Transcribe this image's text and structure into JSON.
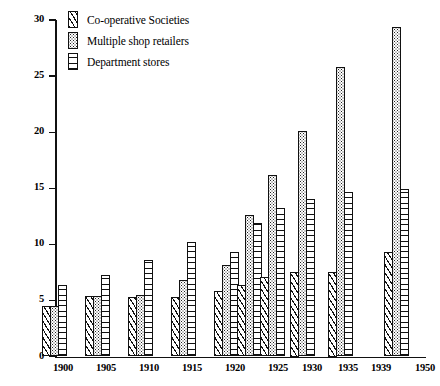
{
  "chart_data": {
    "type": "bar",
    "title": "",
    "xlabel": "",
    "ylabel": "",
    "ylim": [
      0,
      30
    ],
    "ytick_values": [
      0,
      5,
      10,
      15,
      20,
      25,
      30
    ],
    "ytick_labels": [
      "0",
      "5",
      "10",
      "15",
      "20",
      "25",
      "30"
    ],
    "grid": false,
    "legend_position": "top-left",
    "categories": [
      "1900",
      "1905",
      "1910",
      "1915",
      "1920",
      "1925",
      "1930",
      "1935",
      "1939",
      "1950"
    ],
    "series": [
      {
        "name": "Co-operative Societies",
        "pattern": "diagonal-hatch",
        "values": [
          4.5,
          5.4,
          5.3,
          5.3,
          5.8,
          6.4,
          7.1,
          7.5,
          7.5,
          9.3
        ]
      },
      {
        "name": "Multiple shop retailers",
        "pattern": "stipple-dots",
        "values": [
          4.5,
          5.4,
          5.5,
          6.8,
          8.2,
          12.6,
          16.2,
          20.1,
          25.8,
          29.4
        ]
      },
      {
        "name": "Department stores",
        "pattern": "horizontal-ladder",
        "values": [
          6.4,
          7.3,
          8.6,
          10.2,
          9.3,
          11.9,
          13.2,
          14.0,
          14.7,
          14.9
        ]
      }
    ]
  },
  "legend": {
    "items": [
      {
        "label": "Co-operative Societies"
      },
      {
        "label": "Multiple shop retailers"
      },
      {
        "label": "Department stores"
      }
    ]
  }
}
